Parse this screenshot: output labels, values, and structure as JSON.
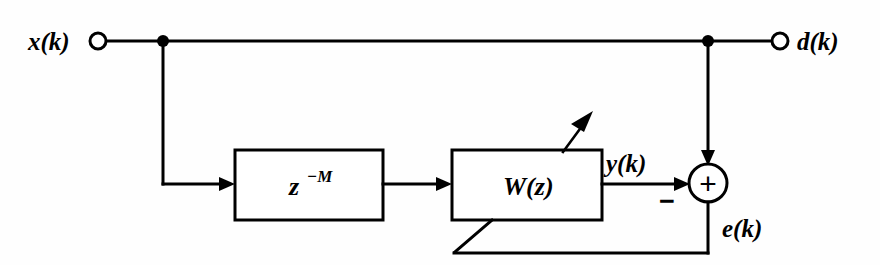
{
  "diagram": {
    "type": "signal-flow-block-diagram",
    "background_color": "#fefefe",
    "line_color": "#000000",
    "terminals": [
      {
        "id": "input",
        "label": "x(k)",
        "role": "input-terminal"
      },
      {
        "id": "desired",
        "label": "d(k)",
        "role": "input-terminal"
      }
    ],
    "blocks": [
      {
        "id": "delay",
        "label_base": "z",
        "label_exponent": "−M",
        "label_full": "z−M",
        "role": "delay-block"
      },
      {
        "id": "filter",
        "label": "W(z)",
        "role": "adaptive-filter-block"
      }
    ],
    "summing_junction": {
      "id": "sum",
      "operator": "+",
      "negative_input_sign": "−"
    },
    "signals": [
      {
        "id": "y",
        "label": "y(k)",
        "role": "filter-output"
      },
      {
        "id": "e",
        "label": "e(k)",
        "role": "error-signal"
      }
    ],
    "annotations": {
      "adaptation_arrow": "adaptation-arrow",
      "feedback_path": "error-feedback-to-filter"
    }
  }
}
